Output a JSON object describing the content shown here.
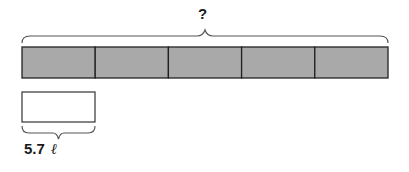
{
  "diagram": {
    "total_label": "?",
    "segment_count": 5,
    "segment_fill": "#a9a9a9",
    "part_value": "5.7",
    "part_unit": "ℓ"
  }
}
